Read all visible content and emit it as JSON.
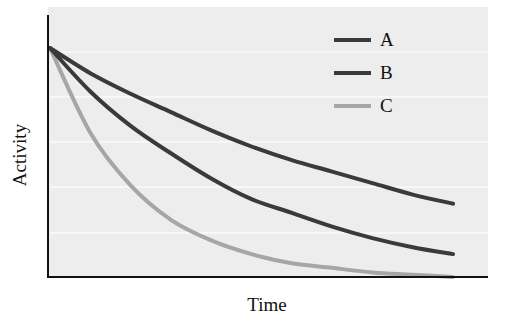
{
  "chart_data": {
    "type": "line",
    "title": "",
    "xlabel": "Time",
    "ylabel": "Activity",
    "x": [
      0,
      1,
      2,
      3,
      4,
      5,
      6,
      7,
      8,
      9,
      10
    ],
    "series": [
      {
        "name": "A",
        "color": "#3a3a3a",
        "values": [
          1.0,
          0.89,
          0.8,
          0.72,
          0.64,
          0.57,
          0.51,
          0.46,
          0.41,
          0.36,
          0.32
        ]
      },
      {
        "name": "B",
        "color": "#3a3a3a",
        "values": [
          1.0,
          0.81,
          0.66,
          0.54,
          0.43,
          0.34,
          0.28,
          0.22,
          0.17,
          0.13,
          0.1
        ]
      },
      {
        "name": "C",
        "color": "#a6a6a6",
        "values": [
          1.0,
          0.63,
          0.4,
          0.25,
          0.16,
          0.1,
          0.06,
          0.04,
          0.02,
          0.01,
          0.0
        ]
      }
    ],
    "xlim": [
      0,
      11
    ],
    "ylim": [
      0,
      1.05
    ],
    "grid": true,
    "ticks": "none",
    "legend_position": "upper right"
  },
  "axes": {
    "x_label": "Time",
    "y_label": "Activity"
  },
  "legend": [
    {
      "label": "A",
      "color": "#3a3a3a"
    },
    {
      "label": "B",
      "color": "#3a3a3a"
    },
    {
      "label": "C",
      "color": "#a6a6a6"
    }
  ],
  "colors": {
    "plot_background": "#ededed",
    "gridline": "#fafafa",
    "axis": "#111111"
  }
}
